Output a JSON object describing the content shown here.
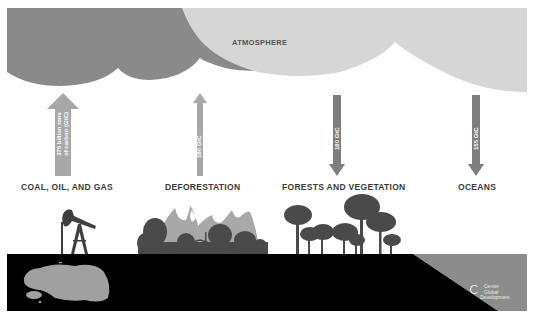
{
  "diagram": {
    "title": "ATMOSPHERE",
    "colors": {
      "atmosphere_dark": "#8a8a8a",
      "atmosphere_light": "#d6d6d6",
      "arrow_source": "#a8a8a8",
      "arrow_sink": "#7e7e7e",
      "ground": "#000000",
      "ocean": "#8c8c8c",
      "oil_spill": "#a0a0a0",
      "tree": "#4a4a4a",
      "flame": "#a8a8a8"
    },
    "flows": [
      {
        "label": "COAL, OIL, AND GAS",
        "value_text_line1": "375 billion tons",
        "value_text_line2": "of carbon (GtC)",
        "direction": "up",
        "icon": "oil-pump-icon"
      },
      {
        "label": "DEFORESTATION",
        "value_text": "180 GtC",
        "direction": "up",
        "icon": "burning-forest-icon"
      },
      {
        "label": "FORESTS AND VEGETATION",
        "value_text": "160 GtC",
        "direction": "down",
        "icon": "trees-icon"
      },
      {
        "label": "OCEANS",
        "value_text": "155 GtC",
        "direction": "down",
        "icon": "ocean-icon"
      }
    ],
    "logo": {
      "line1": "Center",
      "line2": "Global",
      "line3": "Development"
    }
  }
}
